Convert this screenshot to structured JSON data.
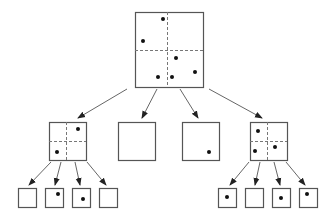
{
  "diagram": {
    "type": "quadtree",
    "colors": {
      "stroke": "#555555",
      "dash": "#777777",
      "dot": "#111111",
      "background": "#ffffff"
    },
    "nodes": [
      {
        "id": "root",
        "x": 135,
        "y": 12,
        "w": 68,
        "h": 75,
        "split": true,
        "dots": [
          [
            28,
            7
          ],
          [
            8,
            29
          ],
          [
            41,
            46
          ],
          [
            60,
            60
          ],
          [
            23,
            65
          ],
          [
            37,
            65
          ]
        ]
      },
      {
        "id": "nw",
        "x": 49,
        "y": 122,
        "w": 37,
        "h": 38,
        "split": true,
        "dots": [
          [
            29,
            7
          ],
          [
            8,
            30
          ]
        ]
      },
      {
        "id": "ne",
        "x": 118,
        "y": 122,
        "w": 37,
        "h": 38,
        "split": false,
        "dots": []
      },
      {
        "id": "sw",
        "x": 182,
        "y": 122,
        "w": 37,
        "h": 38,
        "split": false,
        "dots": [
          [
            27,
            30
          ]
        ]
      },
      {
        "id": "se",
        "x": 250,
        "y": 122,
        "w": 37,
        "h": 38,
        "split": true,
        "dots": [
          [
            8,
            9
          ],
          [
            5,
            29
          ],
          [
            25,
            25
          ]
        ]
      },
      {
        "id": "nw-nw",
        "x": 18,
        "y": 188,
        "w": 18,
        "h": 19,
        "split": false,
        "dots": []
      },
      {
        "id": "nw-ne",
        "x": 45,
        "y": 188,
        "w": 18,
        "h": 19,
        "split": false,
        "dots": [
          [
            13,
            6
          ]
        ]
      },
      {
        "id": "nw-sw",
        "x": 72,
        "y": 188,
        "w": 18,
        "h": 19,
        "split": false,
        "dots": [
          [
            11,
            11
          ]
        ]
      },
      {
        "id": "nw-se",
        "x": 99,
        "y": 188,
        "w": 18,
        "h": 19,
        "split": false,
        "dots": []
      },
      {
        "id": "se-nw",
        "x": 218,
        "y": 188,
        "w": 18,
        "h": 19,
        "split": false,
        "dots": [
          [
            9,
            9
          ]
        ]
      },
      {
        "id": "se-ne",
        "x": 245,
        "y": 188,
        "w": 18,
        "h": 19,
        "split": false,
        "dots": []
      },
      {
        "id": "se-sw",
        "x": 272,
        "y": 188,
        "w": 18,
        "h": 19,
        "split": false,
        "dots": [
          [
            9,
            10
          ]
        ]
      },
      {
        "id": "se-se",
        "x": 299,
        "y": 188,
        "w": 18,
        "h": 19,
        "split": false,
        "dots": [
          [
            8,
            6
          ]
        ]
      }
    ],
    "edges": [
      {
        "from": [
          127,
          89
        ],
        "to": [
          78,
          118
        ]
      },
      {
        "from": [
          157,
          89
        ],
        "to": [
          142,
          118
        ]
      },
      {
        "from": [
          180,
          89
        ],
        "to": [
          198,
          118
        ]
      },
      {
        "from": [
          209,
          89
        ],
        "to": [
          262,
          118
        ]
      },
      {
        "from": [
          51,
          162
        ],
        "to": [
          29,
          185
        ]
      },
      {
        "from": [
          61,
          162
        ],
        "to": [
          55,
          185
        ]
      },
      {
        "from": [
          75,
          162
        ],
        "to": [
          80,
          185
        ]
      },
      {
        "from": [
          87,
          162
        ],
        "to": [
          106,
          185
        ]
      },
      {
        "from": [
          249,
          162
        ],
        "to": [
          230,
          185
        ]
      },
      {
        "from": [
          260,
          162
        ],
        "to": [
          255,
          185
        ]
      },
      {
        "from": [
          274,
          162
        ],
        "to": [
          280,
          185
        ]
      },
      {
        "from": [
          286,
          162
        ],
        "to": [
          305,
          185
        ]
      }
    ]
  }
}
